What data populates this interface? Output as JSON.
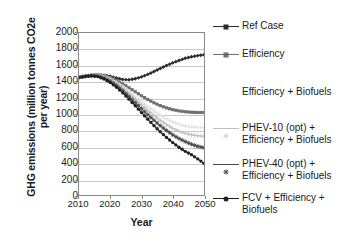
{
  "chart_data": {
    "type": "line",
    "title": "",
    "xlabel": "Year",
    "ylabel": "GHG emissions (million tonnes CO2e per year)",
    "xlim": [
      2010,
      2050
    ],
    "ylim": [
      0,
      2000
    ],
    "xticks": [
      "2010",
      "2020",
      "2030",
      "2040",
      "2050"
    ],
    "yticks": [
      "0",
      "200",
      "400",
      "600",
      "800",
      "1000",
      "1200",
      "1400",
      "1600",
      "1800",
      "2000"
    ],
    "grid": true,
    "legend_position": "right",
    "x": [
      2010,
      2012,
      2014,
      2016,
      2018,
      2020,
      2022,
      2024,
      2026,
      2028,
      2030,
      2032,
      2034,
      2036,
      2038,
      2040,
      2042,
      2044,
      2046,
      2048,
      2050
    ],
    "series": [
      {
        "name": "Ref Case",
        "color": "#2b2b2b",
        "marker": "diamond",
        "values": [
          1450,
          1465,
          1478,
          1482,
          1478,
          1463,
          1442,
          1424,
          1420,
          1432,
          1456,
          1487,
          1523,
          1560,
          1597,
          1630,
          1660,
          1686,
          1706,
          1720,
          1730
        ]
      },
      {
        "name": "Efficiency",
        "color": "#6e6e6e",
        "marker": "square",
        "values": [
          1450,
          1465,
          1478,
          1482,
          1472,
          1450,
          1414,
          1370,
          1322,
          1272,
          1222,
          1176,
          1135,
          1100,
          1072,
          1050,
          1035,
          1025,
          1018,
          1015,
          1015
        ]
      },
      {
        "name": "Efficiency + Biofuels",
        "color": "#e2e2e2",
        "marker": "plus",
        "values": [
          1450,
          1465,
          1478,
          1480,
          1462,
          1432,
          1388,
          1334,
          1274,
          1212,
          1150,
          1090,
          1034,
          982,
          936,
          898,
          868,
          848,
          836,
          830,
          828
        ]
      },
      {
        "name": "PHEV-10 (opt) +\nEfficiency + Biofuels",
        "color": "#bfbfbf",
        "marker": "plus",
        "values": [
          1450,
          1464,
          1476,
          1476,
          1455,
          1422,
          1374,
          1316,
          1250,
          1180,
          1110,
          1042,
          978,
          918,
          864,
          818,
          782,
          756,
          738,
          726,
          720
        ]
      },
      {
        "name": "PHEV-40 (opt) +\nEfficiency + Biofuels",
        "color": "#4a4a4a",
        "marker": "star",
        "values": [
          1450,
          1463,
          1472,
          1468,
          1443,
          1404,
          1350,
          1286,
          1214,
          1138,
          1062,
          988,
          918,
          852,
          792,
          738,
          692,
          654,
          622,
          596,
          578
        ]
      },
      {
        "name": "FCV + Efficiency +\nBiofuels",
        "color": "#1f1f1f",
        "marker": "circle",
        "values": [
          1450,
          1462,
          1468,
          1460,
          1430,
          1386,
          1328,
          1258,
          1180,
          1098,
          1014,
          932,
          852,
          776,
          706,
          642,
          584,
          534,
          492,
          440,
          385
        ]
      }
    ]
  },
  "legend": {
    "items": [
      {
        "label": "Ref Case"
      },
      {
        "label": "Efficiency"
      },
      {
        "label": "Efficiency + Biofuels"
      },
      {
        "label": "PHEV-10 (opt) +\nEfficiency + Biofuels"
      },
      {
        "label": "PHEV-40 (opt) +\nEfficiency + Biofuels"
      },
      {
        "label": "FCV + Efficiency +\nBiofuels"
      }
    ]
  }
}
